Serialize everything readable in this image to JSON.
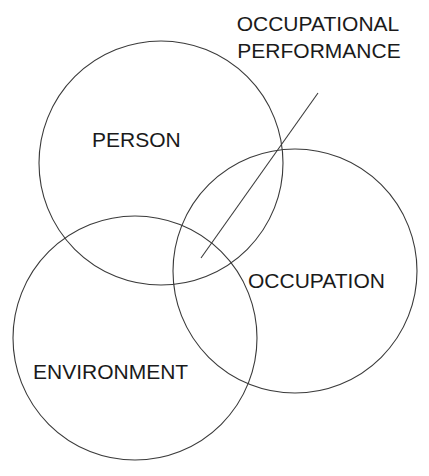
{
  "diagram": {
    "type": "venn",
    "colors": {
      "stroke": "#3a3a3a",
      "text": "#1a1a1a",
      "background": "#ffffff"
    },
    "circles": [
      {
        "id": "person",
        "label": "PERSON",
        "cx": 161,
        "cy": 163,
        "r": 122
      },
      {
        "id": "occupation",
        "label": "OCCUPATION",
        "cx": 295,
        "cy": 271,
        "r": 122
      },
      {
        "id": "environment",
        "label": "ENVIRONMENT",
        "cx": 135,
        "cy": 338,
        "r": 122
      }
    ],
    "callout": {
      "lines": [
        "OCCUPATIONAL",
        "PERFORMANCE"
      ],
      "pointer": {
        "x1": 318,
        "y1": 93,
        "x2": 201,
        "y2": 258
      }
    }
  }
}
